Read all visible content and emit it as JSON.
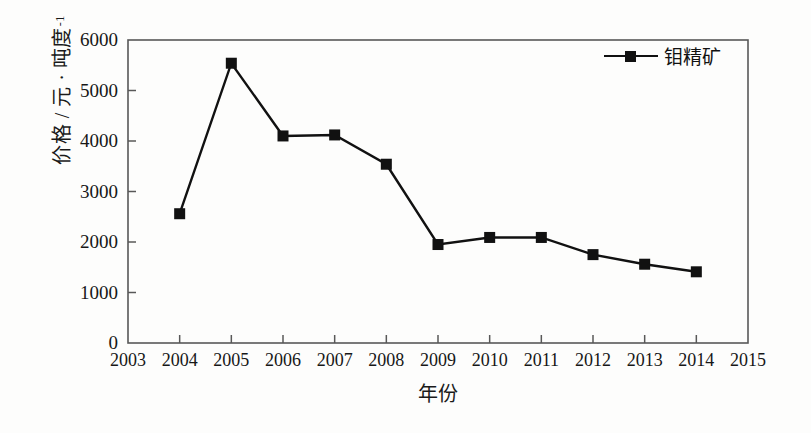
{
  "chart_data": {
    "type": "line",
    "title": "",
    "xlabel": "年份",
    "ylabel": "价格 / 元 · 吨度",
    "ylabel_superscript": "-1",
    "x": [
      2004,
      2005,
      2006,
      2007,
      2008,
      2009,
      2010,
      2011,
      2012,
      2013,
      2014
    ],
    "series": [
      {
        "name": "钼精矿",
        "values": [
          2560,
          5540,
          4100,
          4120,
          3540,
          1950,
          2090,
          2090,
          1750,
          1560,
          1410
        ]
      }
    ],
    "xticks": [
      2003,
      2004,
      2005,
      2006,
      2007,
      2008,
      2009,
      2010,
      2011,
      2012,
      2013,
      2014,
      2015
    ],
    "xtick_labels": [
      "2003",
      "2004",
      "2005",
      "2006",
      "2007",
      "2008",
      "2009",
      "2010",
      "2011",
      "2012",
      "2013",
      "2014",
      "2015"
    ],
    "yticks": [
      0,
      1000,
      2000,
      3000,
      4000,
      5000,
      6000
    ],
    "ytick_labels": [
      "0",
      "1000",
      "2000",
      "3000",
      "4000",
      "5000",
      "6000"
    ],
    "xlim": [
      2003,
      2015
    ],
    "ylim": [
      0,
      6000
    ],
    "grid": false,
    "legend_position": "top-right",
    "marker": "square",
    "line_color": "#111111",
    "marker_color": "#111111",
    "background_color": "#fdfdfc",
    "axis_color": "#4a4a4a"
  },
  "legend": {
    "entries": [
      {
        "label": "钼精矿"
      }
    ]
  },
  "axes": {
    "x_title": "年份",
    "y_title_main": "价格 / 元 · 吨度",
    "y_title_sup": "-1"
  }
}
